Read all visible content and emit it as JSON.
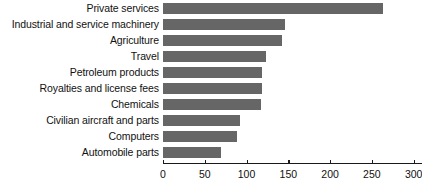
{
  "chart_data": {
    "type": "bar",
    "orientation": "horizontal",
    "title": "",
    "subtitle": "",
    "xlabel": "",
    "ylabel": "",
    "xlim": [
      0,
      310
    ],
    "xticks": [
      0,
      50,
      100,
      150,
      200,
      250,
      300
    ],
    "xtick_labels": [
      "0",
      "50",
      "100",
      "150",
      "200",
      "250",
      "300"
    ],
    "grid": false,
    "legend": false,
    "bar_color": "#666666",
    "axis_color": "#1a1a1a",
    "text_color": "#111111",
    "categories": [
      "Private services",
      "Industrial and service machinery",
      "Agriculture",
      "Travel",
      "Petroleum products",
      "Royalties and license fees",
      "Chemicals",
      "Civilian aircraft and parts",
      "Computers",
      "Automobile parts"
    ],
    "values": [
      263,
      146,
      142,
      123,
      118,
      118,
      117,
      92,
      88,
      70
    ]
  }
}
